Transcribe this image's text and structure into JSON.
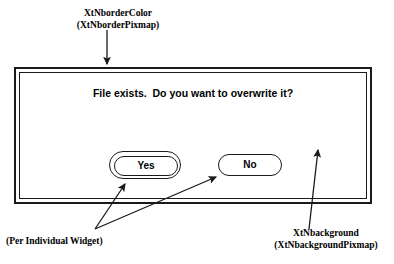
{
  "figure": {
    "ink_color": "#1a1a1a",
    "paper_color": "#ffffff"
  },
  "annotations": {
    "border_color": {
      "line1": "XtNborderColor",
      "line2": "(XtNborderPixmap)"
    },
    "background": {
      "line1": "XtNbackground",
      "line2": "(XtNbackgroundPixmap)"
    },
    "per_widget": {
      "line1": "(Per Individual Widget)"
    }
  },
  "dialog": {
    "message": "File exists.  Do you want to overwrite it?",
    "buttons": [
      {
        "label": "Yes",
        "default": true
      },
      {
        "label": "No",
        "default": false
      }
    ]
  },
  "arrows": [
    {
      "name": "arrow-to-border",
      "from": [
        107,
        30
      ],
      "to": [
        107,
        66
      ]
    },
    {
      "name": "arrow-to-yes-button",
      "from": [
        95,
        228
      ],
      "to": [
        124,
        183
      ]
    },
    {
      "name": "arrow-to-no-button",
      "from": [
        95,
        228
      ],
      "to": [
        214,
        176
      ]
    },
    {
      "name": "arrow-to-background",
      "from": [
        310,
        228
      ],
      "to": [
        318,
        150
      ]
    }
  ]
}
